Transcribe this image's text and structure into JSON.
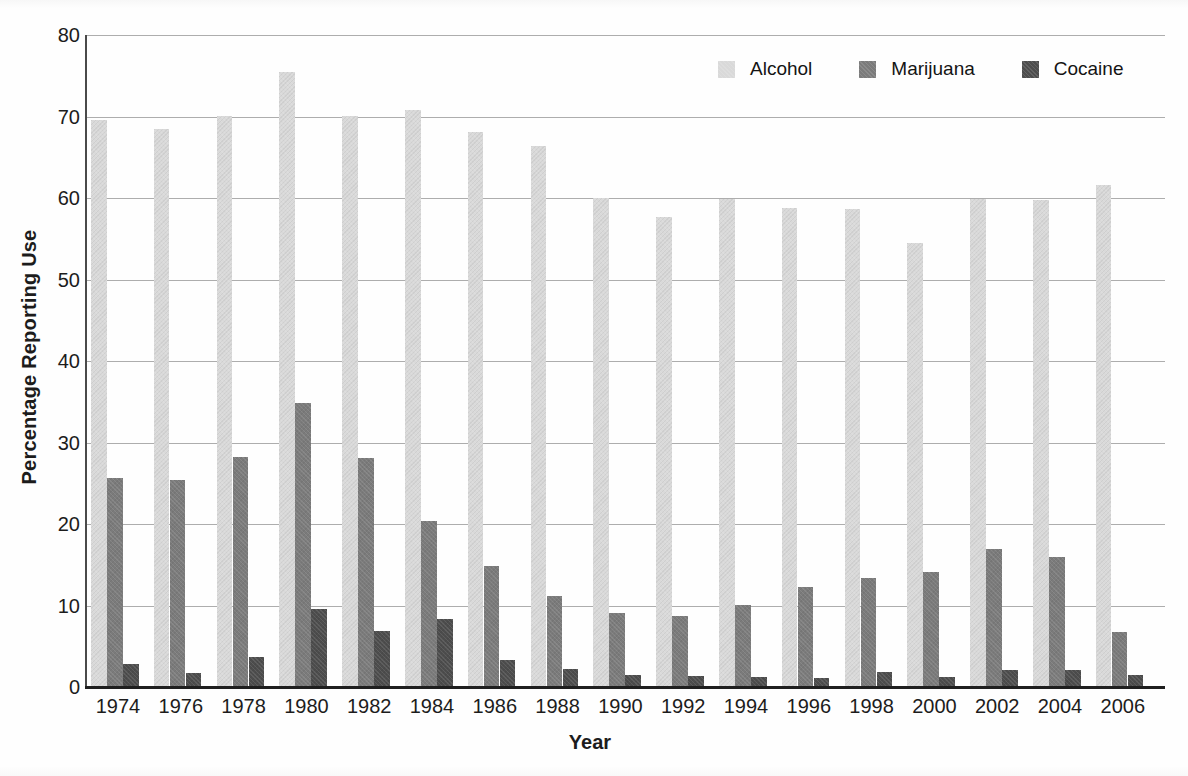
{
  "chart_data": {
    "type": "bar",
    "title": "",
    "xlabel": "Year",
    "ylabel": "Percentage Reporting Use",
    "categories": [
      "1974",
      "1976",
      "1978",
      "1980",
      "1982",
      "1984",
      "1986",
      "1988",
      "1990",
      "1992",
      "1994",
      "1996",
      "1998",
      "2000",
      "2002",
      "2004",
      "2006"
    ],
    "series": [
      {
        "name": "Alcohol",
        "color": "#d9d9d9",
        "values": [
          69.5,
          68.3,
          70.0,
          75.3,
          70.0,
          70.7,
          68.0,
          66.2,
          59.9,
          57.6,
          59.8,
          58.7,
          58.5,
          54.3,
          59.7,
          59.6,
          61.5
        ]
      },
      {
        "name": "Marijuana",
        "color": "#7b7b7b",
        "values": [
          25.5,
          25.3,
          28.1,
          34.7,
          28.0,
          20.3,
          14.7,
          11.1,
          9.0,
          8.6,
          10.0,
          12.2,
          13.3,
          14.0,
          16.8,
          15.8,
          6.6
        ]
      },
      {
        "name": "Cocaine",
        "color": "#4d4d4d",
        "values": [
          2.7,
          1.6,
          3.6,
          9.4,
          6.7,
          8.2,
          3.2,
          2.1,
          1.3,
          1.2,
          1.1,
          1.0,
          1.7,
          1.1,
          2.0,
          2.0,
          1.3
        ]
      }
    ],
    "ylim": [
      0,
      80
    ],
    "yticks": [
      0,
      10,
      20,
      30,
      40,
      50,
      60,
      70,
      80
    ],
    "grid": true,
    "legend_position": "top-right"
  },
  "colors": {
    "gridline": "#adadad",
    "axis_line": "#1f1f1f",
    "background": "#fefefe",
    "text": "#1c1c1c"
  }
}
